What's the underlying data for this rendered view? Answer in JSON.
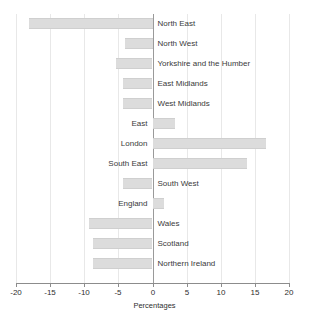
{
  "chart_data": {
    "type": "bar",
    "orientation": "horizontal",
    "title": "",
    "xlabel": "Percentages",
    "ylabel": "",
    "xlim": [
      -20,
      20
    ],
    "xticks": [
      -20,
      -15,
      -10,
      -5,
      0,
      5,
      10,
      15,
      20
    ],
    "xtick_labels": [
      "-20",
      "-15",
      "-10",
      "-5",
      "0",
      "5",
      "10",
      "15",
      "20"
    ],
    "grid": true,
    "legend": null,
    "zero_reference_line": 0,
    "categories": [
      "North East",
      "North West",
      "Yorkshire and the Humber",
      "East Midlands",
      "West Midlands",
      "East",
      "London",
      "South East",
      "South West",
      "England",
      "Wales",
      "Scotland",
      "Northern Ireland"
    ],
    "values": [
      -18.1,
      -4.1,
      -5.3,
      -4.3,
      -4.3,
      3.2,
      16.5,
      13.7,
      -4.3,
      1.6,
      -9.3,
      -8.7,
      -8.7
    ],
    "bars": [
      {
        "category": "North East",
        "value": -18.1,
        "label_side": "right"
      },
      {
        "category": "North West",
        "value": -4.1,
        "label_side": "right"
      },
      {
        "category": "Yorkshire and the Humber",
        "value": -5.3,
        "label_side": "right"
      },
      {
        "category": "East Midlands",
        "value": -4.3,
        "label_side": "right"
      },
      {
        "category": "West Midlands",
        "value": -4.3,
        "label_side": "right"
      },
      {
        "category": "East",
        "value": 3.2,
        "label_side": "left"
      },
      {
        "category": "London",
        "value": 16.5,
        "label_side": "left"
      },
      {
        "category": "South East",
        "value": 13.7,
        "label_side": "left"
      },
      {
        "category": "South West",
        "value": -4.3,
        "label_side": "right"
      },
      {
        "category": "England",
        "value": 1.6,
        "label_side": "left"
      },
      {
        "category": "Wales",
        "value": -9.3,
        "label_side": "right"
      },
      {
        "category": "Scotland",
        "value": -8.7,
        "label_side": "right"
      },
      {
        "category": "Northern Ireland",
        "value": -8.7,
        "label_side": "right"
      }
    ],
    "colors": {
      "bar_fill": "#dcdcdc",
      "bar_edge": "#cfcfcf",
      "gridline": "#e8e8e8",
      "axis": "#8c8c8c",
      "zero_line": "#9a9a9a",
      "text": "#2e2e2e",
      "background": "#ffffff"
    }
  }
}
